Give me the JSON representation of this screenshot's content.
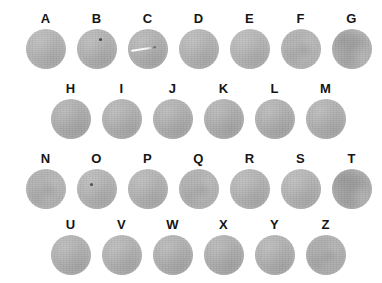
{
  "canvas": {
    "width": 382,
    "height": 283,
    "background_color": "#ffffff"
  },
  "appearance": {
    "disc_color": "#b5b5b5",
    "disc_color_dark": "#adadad",
    "label_color": "#151515",
    "disc_diameter": 40
  },
  "grid": {
    "rows": [
      {
        "row_index": 1,
        "top": 12,
        "left": 20,
        "pitch": 51,
        "cells": [
          {
            "label": "A",
            "texture": "plain",
            "tint": "#b6b6b6",
            "marks": []
          },
          {
            "label": "B",
            "texture": "plain",
            "tint": "#b4b4b4",
            "marks": [
              {
                "type": "dot",
                "x": 22,
                "y": 9
              }
            ]
          },
          {
            "label": "C",
            "texture": "plain",
            "tint": "#b3b3b3",
            "marks": [
              {
                "type": "streak",
                "x": 3,
                "y": 19,
                "length": 25
              }
            ]
          },
          {
            "label": "D",
            "texture": "plain",
            "tint": "#b6b6b6",
            "marks": []
          },
          {
            "label": "E",
            "texture": "plain",
            "tint": "#b7b7b7",
            "marks": []
          },
          {
            "label": "F",
            "texture": "speckled",
            "tint": "#b5b5b5",
            "marks": []
          },
          {
            "label": "G",
            "texture": "mottled",
            "tint": "#b1b1b1",
            "marks": []
          }
        ]
      },
      {
        "row_index": 2,
        "top": 82,
        "left": 45,
        "pitch": 51,
        "cells": [
          {
            "label": "H",
            "texture": "plain",
            "tint": "#b0b0b0",
            "marks": []
          },
          {
            "label": "I",
            "texture": "plain",
            "tint": "#b3b3b3",
            "marks": []
          },
          {
            "label": "J",
            "texture": "plain",
            "tint": "#b2b2b2",
            "marks": []
          },
          {
            "label": "K",
            "texture": "plain",
            "tint": "#b1b1b1",
            "marks": []
          },
          {
            "label": "L",
            "texture": "plain",
            "tint": "#b2b2b2",
            "marks": []
          },
          {
            "label": "M",
            "texture": "plain",
            "tint": "#b3b3b3",
            "marks": []
          }
        ]
      },
      {
        "row_index": 3,
        "top": 152,
        "left": 20,
        "pitch": 51,
        "cells": [
          {
            "label": "N",
            "texture": "speckled",
            "tint": "#b4b4b4",
            "marks": []
          },
          {
            "label": "O",
            "texture": "plain",
            "tint": "#b6b6b6",
            "marks": [
              {
                "type": "dot",
                "x": 13,
                "y": 14
              }
            ]
          },
          {
            "label": "P",
            "texture": "plain",
            "tint": "#b5b5b5",
            "marks": []
          },
          {
            "label": "Q",
            "texture": "speckled",
            "tint": "#b4b4b4",
            "marks": []
          },
          {
            "label": "R",
            "texture": "plain",
            "tint": "#b5b5b5",
            "marks": []
          },
          {
            "label": "S",
            "texture": "plain",
            "tint": "#b6b6b6",
            "marks": []
          },
          {
            "label": "T",
            "texture": "mottled",
            "tint": "#acacac",
            "marks": []
          }
        ]
      },
      {
        "row_index": 4,
        "top": 218,
        "left": 45,
        "pitch": 51,
        "cells": [
          {
            "label": "U",
            "texture": "plain",
            "tint": "#b3b3b3",
            "marks": []
          },
          {
            "label": "V",
            "texture": "plain",
            "tint": "#b4b4b4",
            "marks": []
          },
          {
            "label": "W",
            "texture": "plain",
            "tint": "#b2b2b2",
            "marks": []
          },
          {
            "label": "X",
            "texture": "plain",
            "tint": "#b1b1b1",
            "marks": []
          },
          {
            "label": "Y",
            "texture": "plain",
            "tint": "#b3b3b3",
            "marks": []
          },
          {
            "label": "Z",
            "texture": "speckled",
            "tint": "#b0b0b0",
            "marks": []
          }
        ]
      }
    ]
  }
}
